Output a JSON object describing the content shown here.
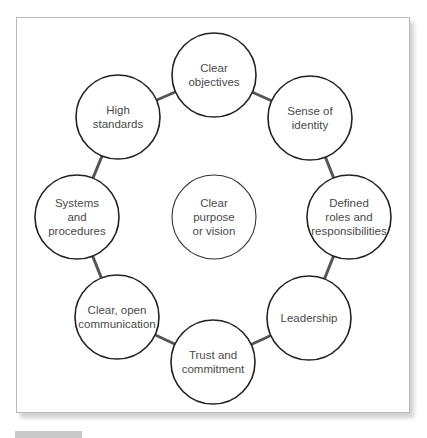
{
  "diagram": {
    "center": {
      "label": "Clear\npurpose\nor vision",
      "cx": 214,
      "cy": 217,
      "r": 42
    },
    "ring_radius_px": 137,
    "nodes": [
      {
        "id": "clear-objectives",
        "label": "Clear\nobjectives",
        "cx": 214,
        "cy": 75
      },
      {
        "id": "sense-of-identity",
        "label": "Sense of\nidentity",
        "cx": 310,
        "cy": 118
      },
      {
        "id": "defined-roles",
        "label": "Defined\nroles and\nresponsibilities",
        "cx": 349,
        "cy": 217
      },
      {
        "id": "leadership",
        "label": "Leadership",
        "cx": 309,
        "cy": 318
      },
      {
        "id": "trust-and-commitment",
        "label": "Trust and\ncommitment",
        "cx": 213,
        "cy": 362
      },
      {
        "id": "clear-open-communication",
        "label": "Clear, open\ncommunication",
        "cx": 117,
        "cy": 317
      },
      {
        "id": "systems-and-procedures",
        "label": "Systems\nand\nprocedures",
        "cx": 77,
        "cy": 217
      },
      {
        "id": "high-standards",
        "label": "High\nstandards",
        "cx": 118,
        "cy": 117
      }
    ],
    "node_radius": 42,
    "colors": {
      "circle_stroke": "#222222",
      "connector": "#555555",
      "text": "#4a4a4a",
      "frame_border": "#b8b8b8",
      "caption_box": "#c9c9c9"
    }
  }
}
